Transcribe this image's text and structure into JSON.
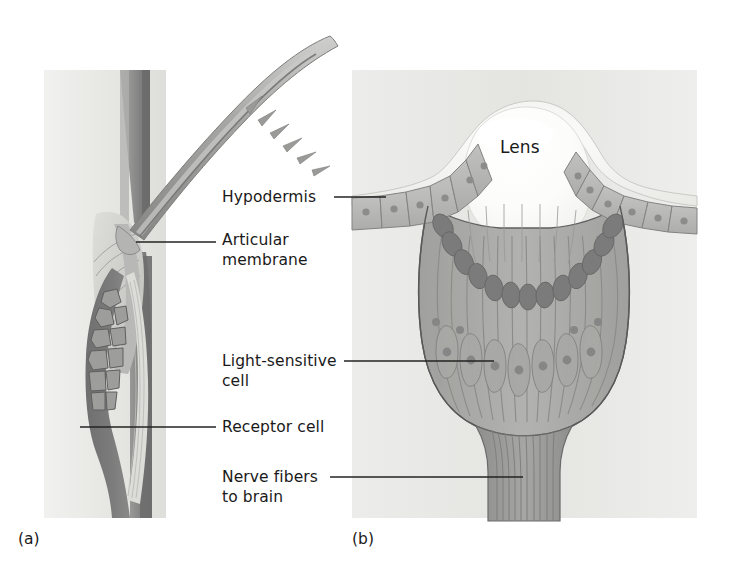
{
  "figure": {
    "kind": "biological-diagram",
    "title": "",
    "background_color": "#ffffff",
    "panels": [
      {
        "tag": "(a)",
        "name": "sensory-bristle-seta",
        "tag_position": {
          "x": 18,
          "y": 530
        },
        "plate_color": "#e9e9e6"
      },
      {
        "tag": "(b)",
        "name": "simple-eye-ocellus",
        "tag_position": {
          "x": 352,
          "y": 530
        },
        "plate_color": "#e6e6e3"
      }
    ]
  },
  "labels": {
    "hypodermis": {
      "text": "Hypodermis",
      "x": 222,
      "y": 188,
      "leader": {
        "x1": 334,
        "y1": 197,
        "x2": 386,
        "y2": 197
      }
    },
    "articular_membrane": {
      "line1": "Articular",
      "line2": "membrane",
      "x": 222,
      "y": 231,
      "leader": {
        "x1": 136,
        "y1": 242,
        "x2": 216,
        "y2": 242
      }
    },
    "light_sensitive_cell": {
      "line1": "Light-sensitive",
      "line2": "cell",
      "x": 222,
      "y": 352,
      "leader": {
        "x1": 344,
        "y1": 361,
        "x2": 494,
        "y2": 361
      }
    },
    "receptor_cell": {
      "text": "Receptor cell",
      "x": 222,
      "y": 418,
      "leader": {
        "x1": 80,
        "y1": 427,
        "x2": 216,
        "y2": 427
      }
    },
    "nerve_fibers_to_brain": {
      "line1": "Nerve fibers",
      "line2": "to brain",
      "x": 222,
      "y": 468,
      "leader": {
        "x1": 330,
        "y1": 477,
        "x2": 523,
        "y2": 477
      }
    },
    "lens": {
      "text": "Lens",
      "x": 523,
      "y": 148
    }
  },
  "colors": {
    "plate_gray": "#e7e7e4",
    "cuticle_mid": "#9a9a98",
    "cuticle_dark": "#6f6f70",
    "bristle_gray": "#a2a2a0",
    "bristle_light": "#c4c4c2",
    "receptor_dark": "#767676",
    "receptor_cells": "#8b8b8a",
    "socket_pale": "#d9d9d6",
    "lens_white": "#fbfbfa",
    "lens_halo": "#ededea",
    "hypodermis_gray": "#b6b6b4",
    "retinula_gray": "#aeaeac",
    "retinula_shade": "#9d9d9b",
    "pigment_dark": "#7a7a7b",
    "nucleus_dot": "#8f8f8f",
    "nerve_bundle": "#9c9c9a",
    "outline": "#5d5d5e",
    "leader_line": "#232323",
    "text": "#1a1a1a"
  },
  "panel_a": {
    "name": "bristle-mechanoreceptor",
    "description_parts": [
      "body-wall-plate",
      "cuticle-column",
      "bristle-shaft-with-spines",
      "articular-membrane-joint",
      "receptor-cell-body",
      "nerve-axon"
    ],
    "bristle_spine_count": 6
  },
  "panel_b": {
    "name": "ocellus-cross-section",
    "hypodermis_cell_count_left": 7,
    "hypodermis_cell_count_right": 7,
    "retinula_cell_count": 17,
    "pigment_granule_count": 20,
    "nerve_fiber_count": 13
  }
}
